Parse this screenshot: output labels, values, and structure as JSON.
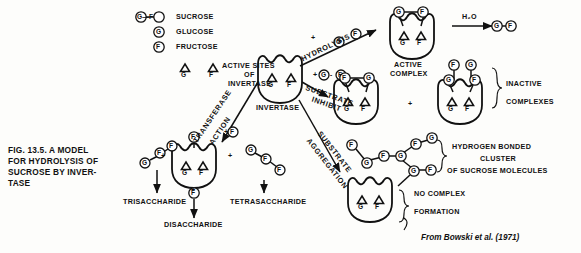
{
  "figure": {
    "caption_lines": [
      "FIG. 13.5. A MODEL",
      "FOR HYDROLYSIS OF",
      "SUCROSE BY INVER-",
      "TASE"
    ],
    "source": "From Bowski et al. (1971)"
  },
  "legend": {
    "items": [
      {
        "symbol": "G—F",
        "label": "SUCROSE"
      },
      {
        "symbol": "G",
        "label": "GLUCOSE"
      },
      {
        "symbol": "F",
        "label": "FRUCTOSE"
      }
    ],
    "active_sites": {
      "site_g": "G",
      "site_f": "F",
      "lines": [
        "ACTIVE SITES",
        "OF",
        "INVERTASE"
      ]
    }
  },
  "enzyme": {
    "name": "INVERTASE",
    "site_left": "G",
    "site_right": "F"
  },
  "pathways": {
    "hydrolysis": "HYDROLYSIS",
    "substrate_inhibition": "SUBSTRATE\nINHIBIT",
    "transferase": "TRANSFERASE",
    "transferase_action": "ACTION",
    "substrate_aggregation": "SUBSTRATE",
    "substrate_aggregation2": "AGGREGATION"
  },
  "active_complex": {
    "lines": [
      "ACTIVE",
      "COMPLEX"
    ],
    "bound_left": "G",
    "bound_right": "F",
    "site_left": "G",
    "site_right": "F",
    "reagent": "H₂O",
    "product_left": "G",
    "product_plus": "+",
    "product_right": "F"
  },
  "inactive_complexes": {
    "lines": [
      "INACTIVE",
      "COMPLEXES"
    ],
    "plus": "+",
    "complex_a": {
      "bound_left": "F",
      "bound_right": "G",
      "site_left": "G",
      "site_right": "F"
    },
    "complex_b": {
      "bound_left": "F",
      "bound_right": "G",
      "site_left": "G",
      "site_right": "F"
    }
  },
  "aggregation": {
    "cluster_lines": [
      "HYDROGEN BONDED",
      "CLUSTER",
      "OF SUCROSE MOLECULES"
    ],
    "no_complex_lines": [
      "NO COMPLEX",
      "FORMATION"
    ],
    "cluster_nodes": [
      "F",
      "G",
      "F",
      "G",
      "F",
      "G",
      "G",
      "F"
    ],
    "site_left": "G",
    "site_right": "F"
  },
  "transferase_products": {
    "plus_left": "+",
    "plus_right": "+",
    "plus_bottom": "+",
    "bound_middle": "F",
    "site_left": "G",
    "site_right": "F",
    "trisaccharide": {
      "label": "TRISACCHARIDE",
      "nodes": [
        "G",
        "F",
        "F"
      ]
    },
    "disaccharide": {
      "label": "DISACCHARIDE",
      "nodes": [
        "F"
      ]
    },
    "tetrasaccharide": {
      "label": "TETRASACCHARIDE",
      "nodes": [
        "G",
        "F",
        "F"
      ]
    },
    "reactant": "F"
  },
  "colors": {
    "ink": "#111111",
    "paper": "#fdfdfb"
  }
}
